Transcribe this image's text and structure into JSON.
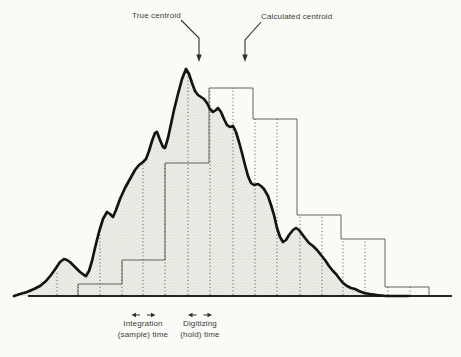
{
  "figure": {
    "annotations": {
      "true_centroid": "True centroid",
      "calculated_centroid": "Calculated centroid",
      "integration_line1": "Integration",
      "integration_line2": "(sample) time",
      "digitizing_line1": "Digitizing",
      "digitizing_line2": "(hold) time"
    },
    "colors": {
      "background": "#fafaf7",
      "curve": "#131313",
      "steps": "#52524e",
      "sample_lines": "#55554f",
      "baseline": "#24241f",
      "fill_base": "#f0f0ea",
      "fill_dot": "#c3c3ba",
      "arrows": "#2e2e2a",
      "text": "#3c3c3c"
    }
  },
  "chart_data": {
    "type": "line",
    "description_of_content": "Smooth analog peak (shaded) overlaid with sample-and-hold histogram staircase",
    "curve_points": [
      [
        14,
        296
      ],
      [
        20,
        294
      ],
      [
        27,
        292
      ],
      [
        34,
        289
      ],
      [
        40,
        286
      ],
      [
        46,
        281
      ],
      [
        51,
        275
      ],
      [
        56,
        268
      ],
      [
        60,
        262
      ],
      [
        64,
        259
      ],
      [
        67,
        260
      ],
      [
        70,
        262
      ],
      [
        75,
        267
      ],
      [
        80,
        272
      ],
      [
        84,
        275
      ],
      [
        86,
        276
      ],
      [
        89,
        271
      ],
      [
        92,
        261
      ],
      [
        95,
        248
      ],
      [
        99,
        232
      ],
      [
        103,
        219
      ],
      [
        107,
        212
      ],
      [
        110,
        214
      ],
      [
        113,
        217
      ],
      [
        116,
        210
      ],
      [
        120,
        199
      ],
      [
        125,
        188
      ],
      [
        130,
        179
      ],
      [
        135,
        170
      ],
      [
        139,
        165
      ],
      [
        143,
        162
      ],
      [
        146,
        159
      ],
      [
        149,
        151
      ],
      [
        152,
        141
      ],
      [
        155,
        133
      ],
      [
        157,
        132
      ],
      [
        160,
        140
      ],
      [
        163,
        147
      ],
      [
        165,
        148
      ],
      [
        168,
        138
      ],
      [
        171,
        124
      ],
      [
        174,
        110
      ],
      [
        178,
        94
      ],
      [
        182,
        79
      ],
      [
        186,
        69
      ],
      [
        189,
        74
      ],
      [
        192,
        83
      ],
      [
        195,
        91
      ],
      [
        198,
        95
      ],
      [
        201,
        97
      ],
      [
        204,
        99
      ],
      [
        207,
        103
      ],
      [
        210,
        109
      ],
      [
        213,
        112
      ],
      [
        216,
        110
      ],
      [
        218,
        108
      ],
      [
        221,
        112
      ],
      [
        224,
        119
      ],
      [
        227,
        125
      ],
      [
        230,
        127
      ],
      [
        233,
        126
      ],
      [
        236,
        132
      ],
      [
        239,
        142
      ],
      [
        242,
        153
      ],
      [
        245,
        165
      ],
      [
        248,
        176
      ],
      [
        251,
        183
      ],
      [
        254,
        185
      ],
      [
        258,
        184
      ],
      [
        261,
        186
      ],
      [
        264,
        189
      ],
      [
        268,
        196
      ],
      [
        271,
        205
      ],
      [
        274,
        215
      ],
      [
        277,
        228
      ],
      [
        280,
        237
      ],
      [
        283,
        242
      ],
      [
        286,
        240
      ],
      [
        289,
        235
      ],
      [
        293,
        230
      ],
      [
        296,
        228
      ],
      [
        299,
        230
      ],
      [
        302,
        234
      ],
      [
        305,
        238
      ],
      [
        309,
        243
      ],
      [
        313,
        246
      ],
      [
        317,
        250
      ],
      [
        321,
        255
      ],
      [
        325,
        260
      ],
      [
        329,
        266
      ],
      [
        333,
        271
      ],
      [
        336,
        274
      ],
      [
        339,
        278
      ],
      [
        343,
        283
      ],
      [
        347,
        286
      ],
      [
        351,
        288
      ],
      [
        355,
        289
      ],
      [
        359,
        291
      ],
      [
        364,
        293
      ],
      [
        370,
        294
      ],
      [
        377,
        295
      ],
      [
        386,
        296
      ],
      [
        396,
        296
      ],
      [
        408,
        296
      ]
    ],
    "bars": {
      "edges": [
        78,
        122,
        165,
        209,
        253,
        297,
        341,
        385,
        429
      ],
      "tops": [
        284,
        260,
        163,
        88,
        119,
        215,
        239,
        287
      ]
    },
    "sample_lines": [
      {
        "x": 57,
        "top": 271
      },
      {
        "x": 78,
        "top": 284
      },
      {
        "x": 100,
        "top": 228
      },
      {
        "x": 122,
        "top": 260
      },
      {
        "x": 143,
        "top": 162
      },
      {
        "x": 165,
        "top": 163
      },
      {
        "x": 188,
        "top": 74
      },
      {
        "x": 210,
        "top": 88
      },
      {
        "x": 233,
        "top": 88
      },
      {
        "x": 255,
        "top": 119
      },
      {
        "x": 277,
        "top": 119
      },
      {
        "x": 300,
        "top": 215
      },
      {
        "x": 322,
        "top": 215
      },
      {
        "x": 343,
        "top": 239
      },
      {
        "x": 365,
        "top": 239
      },
      {
        "x": 388,
        "top": 287
      },
      {
        "x": 410,
        "top": 287
      }
    ],
    "baseline": {
      "y": 296,
      "x1": 28,
      "x2": 452
    },
    "pointer_arrows": [
      {
        "name": "true-centroid-arrow",
        "path": [
          [
            181,
            20
          ],
          [
            199,
            38
          ],
          [
            199,
            55
          ]
        ],
        "tip": [
          199,
          62
        ]
      },
      {
        "name": "calculated-centroid-arrow",
        "path": [
          [
            261,
            22
          ],
          [
            245,
            40
          ],
          [
            245,
            55
          ]
        ],
        "tip": [
          245,
          62
        ]
      }
    ],
    "span_arrows": [
      {
        "name": "integration-span-arrow",
        "y": 315,
        "center": 143.5,
        "gap": 3.5,
        "span": 12
      },
      {
        "name": "digitizing-span-arrow",
        "y": 315,
        "center": 200,
        "gap": 3.5,
        "span": 12
      }
    ]
  }
}
